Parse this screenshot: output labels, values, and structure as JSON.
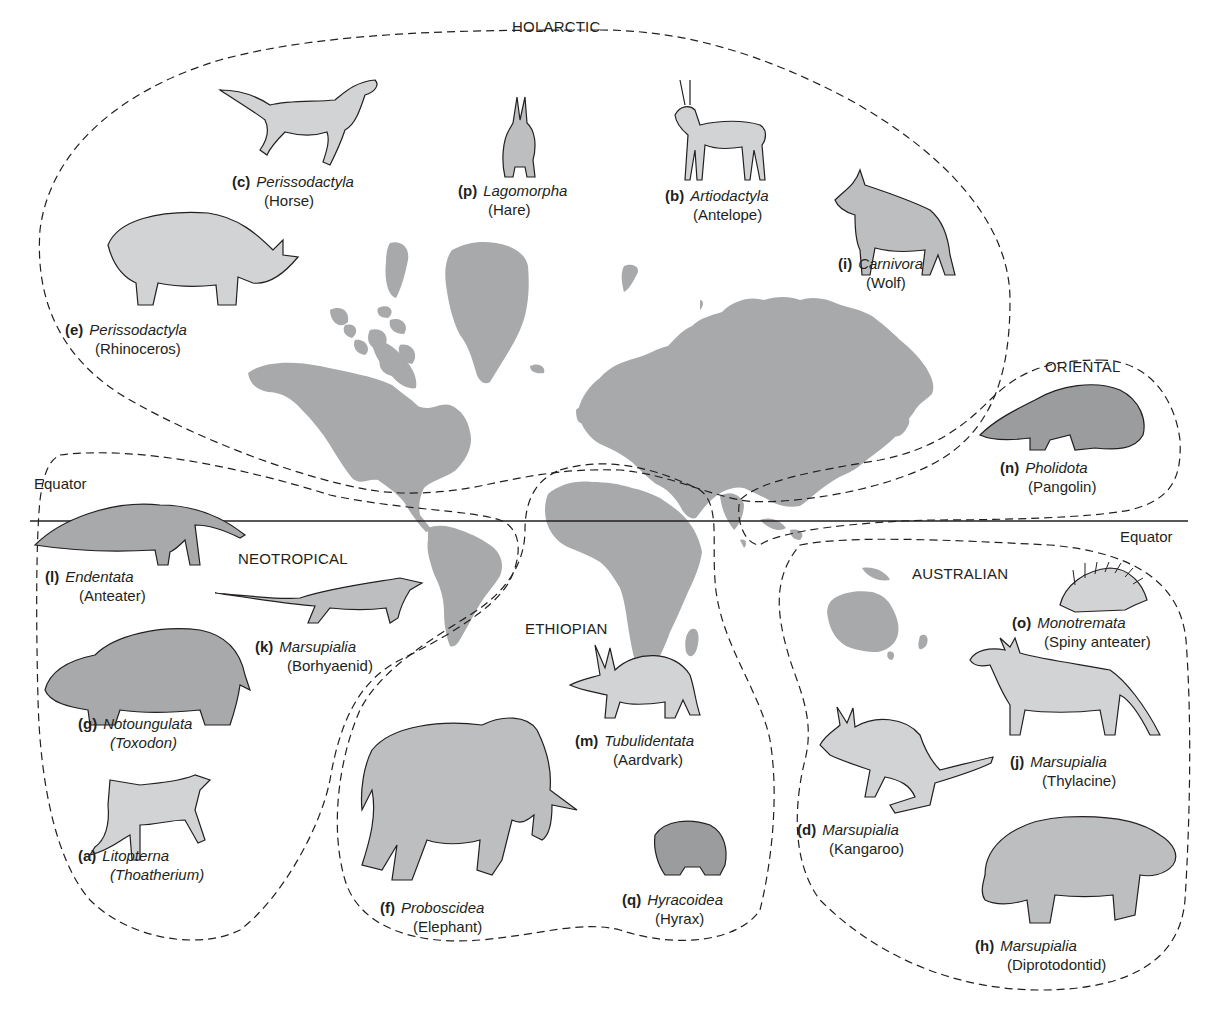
{
  "figure": {
    "type": "biogeographic-realms-map",
    "land_color": "#a7a9ab",
    "line_color": "#231f20",
    "equator": {
      "label_left": "Equator",
      "label_right": "Equator"
    }
  },
  "regions": [
    {
      "id": "holarctic",
      "name": "HOLARCTIC"
    },
    {
      "id": "oriental",
      "name": "ORIENTAL"
    },
    {
      "id": "neotropical",
      "name": "NEOTROPICAL"
    },
    {
      "id": "ethiopian",
      "name": "ETHIOPIAN"
    },
    {
      "id": "australian",
      "name": "AUSTRALIAN"
    }
  ],
  "animals": {
    "c": {
      "letter": "(c)",
      "order": "Perissodactyla",
      "common": "(Horse)",
      "region": "HOLARCTIC"
    },
    "p": {
      "letter": "(p)",
      "order": "Lagomorpha",
      "common": "(Hare)",
      "region": "HOLARCTIC"
    },
    "b": {
      "letter": "(b)",
      "order": "Artiodactyla",
      "common": "(Antelope)",
      "region": "HOLARCTIC"
    },
    "i": {
      "letter": "(i)",
      "order": "Carnivora",
      "common": "(Wolf)",
      "region": "HOLARCTIC"
    },
    "e": {
      "letter": "(e)",
      "order": "Perissodactyla",
      "common": "(Rhinoceros)",
      "region": "HOLARCTIC"
    },
    "n": {
      "letter": "(n)",
      "order": "Pholidota",
      "common": "(Pangolin)",
      "region": "ORIENTAL"
    },
    "l": {
      "letter": "(l)",
      "order": "Endentata",
      "common": "(Anteater)",
      "region": "NEOTROPICAL"
    },
    "k": {
      "letter": "(k)",
      "order": "Marsupialia",
      "common": "(Borhyaenid)",
      "region": "NEOTROPICAL"
    },
    "g": {
      "letter": "(g)",
      "order": "Notoungulata",
      "common": "(Toxodon)",
      "region": "NEOTROPICAL"
    },
    "a": {
      "letter": "(a)",
      "order": "Litopterna",
      "common": "(Thoatherium)",
      "region": "NEOTROPICAL"
    },
    "m": {
      "letter": "(m)",
      "order": "Tubulidentata",
      "common": "(Aardvark)",
      "region": "ETHIOPIAN"
    },
    "f": {
      "letter": "(f)",
      "order": "Proboscidea",
      "common": "(Elephant)",
      "region": "ETHIOPIAN"
    },
    "q": {
      "letter": "(q)",
      "order": "Hyracoidea",
      "common": "(Hyrax)",
      "region": "ETHIOPIAN"
    },
    "o": {
      "letter": "(o)",
      "order": "Monotremata",
      "common": "(Spiny anteater)",
      "region": "AUSTRALIAN"
    },
    "j": {
      "letter": "(j)",
      "order": "Marsupialia",
      "common": "(Thylacine)",
      "region": "AUSTRALIAN"
    },
    "d": {
      "letter": "(d)",
      "order": "Marsupialia",
      "common": "(Kangaroo)",
      "region": "AUSTRALIAN"
    },
    "h": {
      "letter": "(h)",
      "order": "Marsupialia",
      "common": "(Diprotodontid)",
      "region": "AUSTRALIAN"
    }
  }
}
